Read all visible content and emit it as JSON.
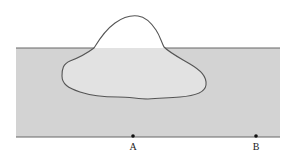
{
  "diagram": {
    "colors": {
      "background": "#ffffff",
      "water": "#d3d3d3",
      "ice_submerged": "#e2e2e2",
      "ice_above": "#ffffff",
      "outline": "#555555",
      "point": "#111111"
    },
    "points": [
      {
        "label": "A",
        "x": 133,
        "y": 136
      },
      {
        "label": "B",
        "x": 256,
        "y": 136
      }
    ]
  }
}
